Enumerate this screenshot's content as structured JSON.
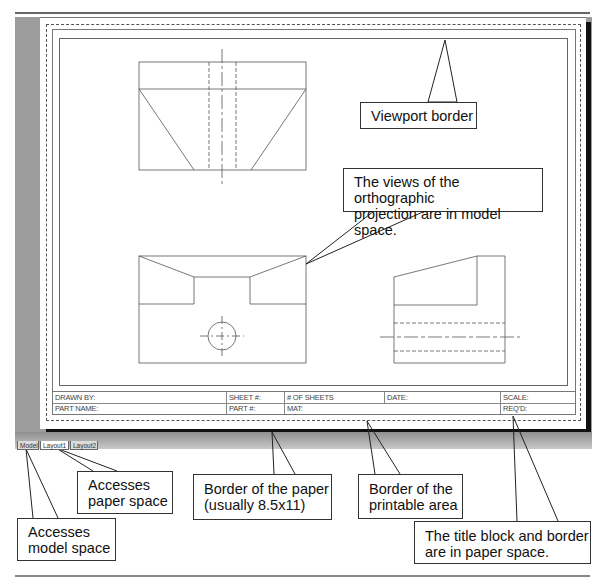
{
  "colors": {
    "workspace_gray": "#9a9a9a",
    "paper": "#ffffff",
    "shadow": "#111111",
    "line": "#555555",
    "callout_border": "#333333",
    "text": "#111111"
  },
  "layout_tabs": [
    {
      "label": "Model",
      "active": false
    },
    {
      "label": "Layout1",
      "active": true
    },
    {
      "label": "Layout2",
      "active": false
    }
  ],
  "title_block": {
    "row1": [
      "DRAWN BY:",
      "SHEET #:",
      "# OF SHEETS",
      "DATE:",
      "SCALE:"
    ],
    "row2": [
      "PART NAME:",
      "PART #:",
      "MAT:",
      "",
      "REQ'D:"
    ]
  },
  "callouts": {
    "viewport_border": "Viewport border",
    "model_space_views": [
      "The views of the orthographic",
      "projection are in model space."
    ],
    "paper_space_tab": [
      "Accesses",
      "paper space"
    ],
    "model_space_tab": [
      "Accesses",
      "model space"
    ],
    "paper_border": [
      "Border of the paper",
      "(usually 8.5x11)"
    ],
    "printable_border": [
      "Border of the",
      "printable area"
    ],
    "title_block_paper_space": [
      "The title block and border",
      "are in paper space."
    ]
  },
  "drawing_views": [
    "top-view",
    "front-view",
    "right-side-view"
  ]
}
